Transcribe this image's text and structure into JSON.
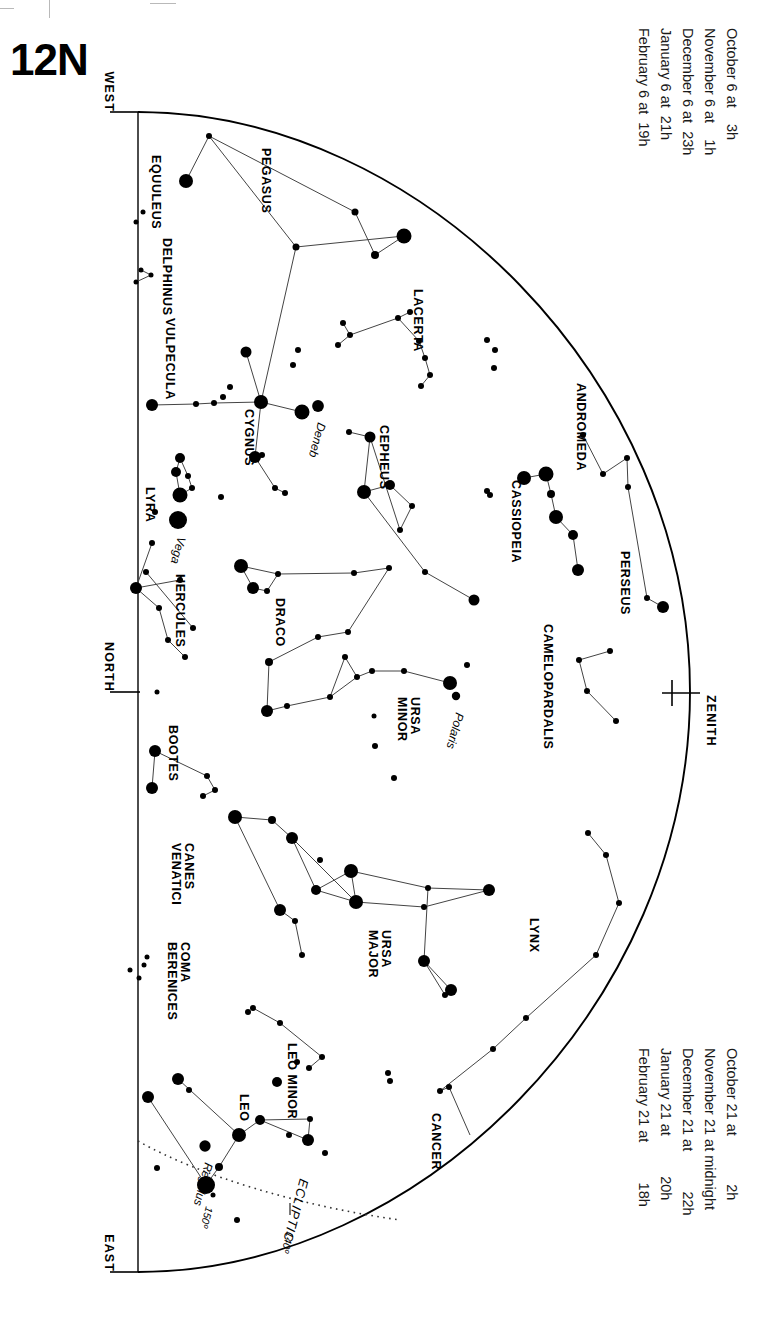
{
  "page": {
    "title": "12N"
  },
  "compass": {
    "west": "WEST",
    "north": "NORTH",
    "east": "EAST",
    "zenith": "ZENITH"
  },
  "date_legend_top": {
    "lines": [
      "October 6 at    3h",
      "November 6 at    1h",
      "December 6 at  23h",
      "January 6 at  21h",
      "February 6 at  19h"
    ]
  },
  "date_legend_bottom": {
    "lines": [
      "October 21 at            2h",
      "November 21 at midnight",
      "December 21 at          22h",
      "January 21 at          20h",
      "February 21 at          18h"
    ]
  },
  "ecliptic": {
    "label": "ECLIPTIC",
    "marks": [
      "150º",
      "140º"
    ]
  },
  "chart_data": {
    "type": "scatter",
    "title": "12N",
    "xlabel": "",
    "ylabel": "",
    "constellations": [
      {
        "name": "EQUULEUS",
        "x": 152,
        "y": 155,
        "rot": 90
      },
      {
        "name": "PEGASUS",
        "x": 262,
        "y": 148,
        "rot": 90
      },
      {
        "name": "DELPHINUS",
        "x": 163,
        "y": 238,
        "rot": 90
      },
      {
        "name": "VULPECULA",
        "x": 166,
        "y": 318,
        "rot": 90
      },
      {
        "name": "LACERTA",
        "x": 414,
        "y": 289,
        "rot": 90
      },
      {
        "name": "ANDROMEDA",
        "x": 577,
        "y": 383,
        "rot": 90
      },
      {
        "name": "CYGNUS",
        "x": 245,
        "y": 409,
        "rot": 90
      },
      {
        "name": "CEPHEUS",
        "x": 380,
        "y": 425,
        "rot": 90
      },
      {
        "name": "CASSIOPEIA",
        "x": 512,
        "y": 480,
        "rot": 90
      },
      {
        "name": "LYRA",
        "x": 146,
        "y": 487,
        "rot": 90
      },
      {
        "name": "PERSEUS",
        "x": 621,
        "y": 551,
        "rot": 90
      },
      {
        "name": "HERCULES",
        "x": 176,
        "y": 574,
        "rot": 90
      },
      {
        "name": "DRACO",
        "x": 276,
        "y": 598,
        "rot": 90
      },
      {
        "name": "CAMELOPARDALIS",
        "x": 544,
        "y": 624,
        "rot": 90
      },
      {
        "name": "URSA MINOR",
        "x": 411,
        "y": 697,
        "rot": 90
      },
      {
        "name": "BOOTES",
        "x": 169,
        "y": 725,
        "rot": 90
      },
      {
        "name": "CANES VENATICI",
        "x": 185,
        "y": 843,
        "rot": 90
      },
      {
        "name": "LYNX",
        "x": 530,
        "y": 918,
        "rot": 90
      },
      {
        "name": "URSA MAJOR",
        "x": 382,
        "y": 930,
        "rot": 90
      },
      {
        "name": "COMA BERENICES",
        "x": 181,
        "y": 942,
        "rot": 90
      },
      {
        "name": "LEO MINOR",
        "x": 288,
        "y": 1043,
        "rot": 90
      },
      {
        "name": "LEO",
        "x": 240,
        "y": 1094,
        "rot": 90
      },
      {
        "name": "CANCER",
        "x": 432,
        "y": 1113,
        "rot": 90
      }
    ],
    "named_stars": [
      {
        "name": "Deneb",
        "x": 318,
        "y": 406,
        "mag": 1.3
      },
      {
        "name": "Vega",
        "x": 178,
        "y": 520,
        "mag": 0.0
      },
      {
        "name": "Polaris",
        "x": 456,
        "y": 696,
        "mag": 2.0
      },
      {
        "name": "Regulus",
        "x": 205,
        "y": 1146,
        "mag": 1.4
      }
    ],
    "horizon": {
      "type": "arc",
      "description": "half-ellipse horizon from WEST through ZENITH to EAST"
    },
    "stars": [
      {
        "x": 186,
        "y": 181,
        "r": 7
      },
      {
        "x": 209,
        "y": 136,
        "r": 3
      },
      {
        "x": 404,
        "y": 236,
        "r": 7.5
      },
      {
        "x": 375,
        "y": 255,
        "r": 4
      },
      {
        "x": 296,
        "y": 247,
        "r": 3.5
      },
      {
        "x": 355,
        "y": 212,
        "r": 3.5
      },
      {
        "x": 136,
        "y": 222,
        "r": 2.5
      },
      {
        "x": 143,
        "y": 212,
        "r": 2.5
      },
      {
        "x": 141,
        "y": 270,
        "r": 2.5
      },
      {
        "x": 151,
        "y": 275,
        "r": 2.5
      },
      {
        "x": 136,
        "y": 282,
        "r": 2.5
      },
      {
        "x": 343,
        "y": 323,
        "r": 3
      },
      {
        "x": 350,
        "y": 335,
        "r": 3
      },
      {
        "x": 338,
        "y": 345,
        "r": 3
      },
      {
        "x": 398,
        "y": 318,
        "r": 3
      },
      {
        "x": 410,
        "y": 312,
        "r": 3
      },
      {
        "x": 419,
        "y": 341,
        "r": 3
      },
      {
        "x": 425,
        "y": 358,
        "r": 3
      },
      {
        "x": 430,
        "y": 375,
        "r": 3
      },
      {
        "x": 421,
        "y": 386,
        "r": 3
      },
      {
        "x": 487,
        "y": 340,
        "r": 3
      },
      {
        "x": 495,
        "y": 350,
        "r": 3
      },
      {
        "x": 494,
        "y": 368,
        "r": 3
      },
      {
        "x": 246,
        "y": 352,
        "r": 5.5
      },
      {
        "x": 230,
        "y": 387,
        "r": 3
      },
      {
        "x": 223,
        "y": 397,
        "r": 3
      },
      {
        "x": 261,
        "y": 402,
        "r": 7
      },
      {
        "x": 302,
        "y": 412,
        "r": 7.5
      },
      {
        "x": 152,
        "y": 405,
        "r": 6
      },
      {
        "x": 196,
        "y": 404,
        "r": 3
      },
      {
        "x": 214,
        "y": 403,
        "r": 3
      },
      {
        "x": 298,
        "y": 350,
        "r": 3
      },
      {
        "x": 293,
        "y": 365,
        "r": 3
      },
      {
        "x": 255,
        "y": 457,
        "r": 6
      },
      {
        "x": 262,
        "y": 455,
        "r": 3
      },
      {
        "x": 275,
        "y": 488,
        "r": 3
      },
      {
        "x": 285,
        "y": 493,
        "r": 3
      },
      {
        "x": 180,
        "y": 458,
        "r": 5
      },
      {
        "x": 176,
        "y": 472,
        "r": 5
      },
      {
        "x": 180,
        "y": 495,
        "r": 7.5
      },
      {
        "x": 188,
        "y": 476,
        "r": 3
      },
      {
        "x": 192,
        "y": 488,
        "r": 3
      },
      {
        "x": 155,
        "y": 512,
        "r": 3
      },
      {
        "x": 221,
        "y": 497,
        "r": 3
      },
      {
        "x": 349,
        "y": 432,
        "r": 3
      },
      {
        "x": 370,
        "y": 437,
        "r": 5.5
      },
      {
        "x": 364,
        "y": 492,
        "r": 7
      },
      {
        "x": 390,
        "y": 485,
        "r": 5
      },
      {
        "x": 412,
        "y": 506,
        "r": 3
      },
      {
        "x": 400,
        "y": 530,
        "r": 3
      },
      {
        "x": 425,
        "y": 572,
        "r": 3
      },
      {
        "x": 474,
        "y": 600,
        "r": 5.5
      },
      {
        "x": 524,
        "y": 478,
        "r": 7
      },
      {
        "x": 546,
        "y": 474,
        "r": 7.5
      },
      {
        "x": 551,
        "y": 494,
        "r": 4
      },
      {
        "x": 556,
        "y": 517,
        "r": 7
      },
      {
        "x": 573,
        "y": 535,
        "r": 5
      },
      {
        "x": 578,
        "y": 570,
        "r": 6
      },
      {
        "x": 490,
        "y": 495,
        "r": 3
      },
      {
        "x": 487,
        "y": 491,
        "r": 3
      },
      {
        "x": 583,
        "y": 435,
        "r": 3
      },
      {
        "x": 603,
        "y": 474,
        "r": 3
      },
      {
        "x": 628,
        "y": 487,
        "r": 3
      },
      {
        "x": 627,
        "y": 458,
        "r": 3
      },
      {
        "x": 647,
        "y": 598,
        "r": 3
      },
      {
        "x": 663,
        "y": 607,
        "r": 6
      },
      {
        "x": 241,
        "y": 566,
        "r": 7
      },
      {
        "x": 253,
        "y": 588,
        "r": 6
      },
      {
        "x": 267,
        "y": 591,
        "r": 3
      },
      {
        "x": 278,
        "y": 574,
        "r": 3
      },
      {
        "x": 354,
        "y": 573,
        "r": 3
      },
      {
        "x": 389,
        "y": 568,
        "r": 3
      },
      {
        "x": 318,
        "y": 637,
        "r": 3
      },
      {
        "x": 348,
        "y": 632,
        "r": 3
      },
      {
        "x": 269,
        "y": 662,
        "r": 4
      },
      {
        "x": 267,
        "y": 711,
        "r": 6
      },
      {
        "x": 287,
        "y": 706,
        "r": 3
      },
      {
        "x": 330,
        "y": 697,
        "r": 3
      },
      {
        "x": 345,
        "y": 657,
        "r": 3
      },
      {
        "x": 357,
        "y": 677,
        "r": 3
      },
      {
        "x": 372,
        "y": 671,
        "r": 3
      },
      {
        "x": 404,
        "y": 671,
        "r": 3
      },
      {
        "x": 450,
        "y": 683,
        "r": 7
      },
      {
        "x": 467,
        "y": 665,
        "r": 3
      },
      {
        "x": 375,
        "y": 746,
        "r": 3
      },
      {
        "x": 394,
        "y": 778,
        "r": 3
      },
      {
        "x": 374,
        "y": 716,
        "r": 2.5
      },
      {
        "x": 136,
        "y": 588,
        "r": 6
      },
      {
        "x": 152,
        "y": 543,
        "r": 3
      },
      {
        "x": 146,
        "y": 572,
        "r": 3
      },
      {
        "x": 159,
        "y": 608,
        "r": 3
      },
      {
        "x": 180,
        "y": 580,
        "r": 3
      },
      {
        "x": 168,
        "y": 640,
        "r": 3
      },
      {
        "x": 185,
        "y": 657,
        "r": 3
      },
      {
        "x": 193,
        "y": 628,
        "r": 3
      },
      {
        "x": 157,
        "y": 692,
        "r": 2.5
      },
      {
        "x": 155,
        "y": 751,
        "r": 6
      },
      {
        "x": 152,
        "y": 788,
        "r": 6
      },
      {
        "x": 207,
        "y": 776,
        "r": 3
      },
      {
        "x": 215,
        "y": 790,
        "r": 3
      },
      {
        "x": 203,
        "y": 796,
        "r": 3
      },
      {
        "x": 235,
        "y": 817,
        "r": 7
      },
      {
        "x": 272,
        "y": 820,
        "r": 4
      },
      {
        "x": 292,
        "y": 838,
        "r": 6
      },
      {
        "x": 316,
        "y": 890,
        "r": 5
      },
      {
        "x": 320,
        "y": 860,
        "r": 3
      },
      {
        "x": 356,
        "y": 902,
        "r": 7
      },
      {
        "x": 351,
        "y": 871,
        "r": 7
      },
      {
        "x": 428,
        "y": 888,
        "r": 3
      },
      {
        "x": 489,
        "y": 890,
        "r": 6
      },
      {
        "x": 424,
        "y": 907,
        "r": 3
      },
      {
        "x": 424,
        "y": 961,
        "r": 6
      },
      {
        "x": 451,
        "y": 990,
        "r": 6
      },
      {
        "x": 445,
        "y": 995,
        "r": 3
      },
      {
        "x": 280,
        "y": 910,
        "r": 6
      },
      {
        "x": 295,
        "y": 921,
        "r": 3
      },
      {
        "x": 302,
        "y": 955,
        "r": 3
      },
      {
        "x": 253,
        "y": 1008,
        "r": 3
      },
      {
        "x": 248,
        "y": 1012,
        "r": 3
      },
      {
        "x": 130,
        "y": 970,
        "r": 2.5
      },
      {
        "x": 144,
        "y": 965,
        "r": 2.5
      },
      {
        "x": 147,
        "y": 957,
        "r": 2.5
      },
      {
        "x": 139,
        "y": 978,
        "r": 2.5
      },
      {
        "x": 588,
        "y": 833,
        "r": 3
      },
      {
        "x": 606,
        "y": 855,
        "r": 3
      },
      {
        "x": 619,
        "y": 903,
        "r": 3
      },
      {
        "x": 596,
        "y": 955,
        "r": 3
      },
      {
        "x": 526,
        "y": 1018,
        "r": 3
      },
      {
        "x": 493,
        "y": 1049,
        "r": 3
      },
      {
        "x": 440,
        "y": 1091,
        "r": 3
      },
      {
        "x": 449,
        "y": 1087,
        "r": 3
      },
      {
        "x": 579,
        "y": 660,
        "r": 3
      },
      {
        "x": 610,
        "y": 651,
        "r": 3
      },
      {
        "x": 587,
        "y": 691,
        "r": 3
      },
      {
        "x": 616,
        "y": 721,
        "r": 3
      },
      {
        "x": 390,
        "y": 1081,
        "r": 3
      },
      {
        "x": 388,
        "y": 1073,
        "r": 3
      },
      {
        "x": 277,
        "y": 1082,
        "r": 5
      },
      {
        "x": 297,
        "y": 1062,
        "r": 3
      },
      {
        "x": 309,
        "y": 1068,
        "r": 3
      },
      {
        "x": 322,
        "y": 1057,
        "r": 3
      },
      {
        "x": 280,
        "y": 1023,
        "r": 3
      },
      {
        "x": 178,
        "y": 1079,
        "r": 6
      },
      {
        "x": 148,
        "y": 1097,
        "r": 6
      },
      {
        "x": 189,
        "y": 1090,
        "r": 3
      },
      {
        "x": 239,
        "y": 1135,
        "r": 7
      },
      {
        "x": 260,
        "y": 1120,
        "r": 5
      },
      {
        "x": 310,
        "y": 1119,
        "r": 3
      },
      {
        "x": 308,
        "y": 1140,
        "r": 6
      },
      {
        "x": 219,
        "y": 1167,
        "r": 4
      },
      {
        "x": 206,
        "y": 1185,
        "r": 9
      },
      {
        "x": 157,
        "y": 1168,
        "r": 3
      },
      {
        "x": 213,
        "y": 1195,
        "r": 2.5
      },
      {
        "x": 237,
        "y": 1220,
        "r": 3
      },
      {
        "x": 325,
        "y": 1153,
        "r": 3
      },
      {
        "x": 289,
        "y": 1135,
        "r": 3
      }
    ]
  }
}
